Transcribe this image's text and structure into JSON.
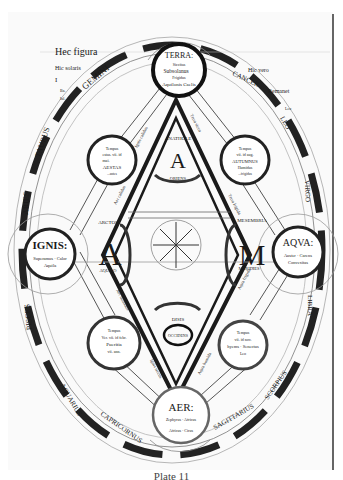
{
  "diagram": {
    "kind": "medieval cosmological manuscript diagram",
    "elements": [
      {
        "name": "TERRA",
        "lines": [
          "TERRA:",
          "Siccitas",
          "Subsolanus",
          "Frigidus",
          "Aquilonis Caelis"
        ]
      },
      {
        "name": "IGNIS",
        "lines": [
          "IGNIS:",
          "Superamus · Calor",
          "Aquila"
        ]
      },
      {
        "name": "AQVA",
        "lines": [
          "AQVA:",
          "Auster · Carens",
          "Convexitas"
        ]
      },
      {
        "name": "AER",
        "lines": [
          "AER:",
          "Zephyrus · Africus",
          "Africus · Cirus"
        ]
      }
    ],
    "seasons": [
      {
        "position": "upper-left",
        "lines": [
          "Tempus",
          "estas. vii. id",
          "mai.",
          "AESTAS",
          "...antes"
        ]
      },
      {
        "position": "upper-right",
        "lines": [
          "Tempus",
          "vii. id aug.",
          "AUTUMNUS",
          "Humidus",
          "...frigidus"
        ]
      },
      {
        "position": "lower-left",
        "lines": [
          "Tempus",
          "Ver. vii. id febr.",
          "Pueritia",
          "vii. ann."
        ]
      },
      {
        "position": "lower-right",
        "lines": [
          "Tempus",
          "vii. id nov.",
          "hyems · Senectus",
          "Leo"
        ]
      }
    ],
    "adam_letters": [
      {
        "letter": "A",
        "label": "ANATHOLE",
        "sub": "ORIENS"
      },
      {
        "letter": "A",
        "label": "ARCTOS",
        "sub": "AQUILO"
      },
      {
        "letter": "M",
        "label": "MESEMBRIA",
        "sub": "MERIDIES"
      },
      {
        "letter": "D",
        "label": "DISIS",
        "sub": "OCCIDENS"
      }
    ],
    "zodiac": [
      "GEMINI",
      "TAURUS",
      "ARIES",
      "PISCES",
      "AQUARIUS",
      "CAPRICORNUS",
      "SAGITTARIUS",
      "SCORPIUS",
      "LIBRA",
      "VIRGO",
      "LEO",
      "CANCER"
    ],
    "edge_labels": [
      "Terra sicca",
      "Terra frigida",
      "Ignis calidus",
      "Aer calidus",
      "Aqua frigida",
      "Aer humidus",
      "Ignis siccus",
      "Aqua humida"
    ],
    "side_text_left": [
      "Hec figura",
      "Hic solaris",
      "I",
      "Ba.",
      "Iul."
    ],
    "side_text_right": [
      "Hic vero",
      "Remanet",
      "Leo"
    ],
    "center": "compass rose / wheel of winds"
  },
  "caption": "Plate 11"
}
